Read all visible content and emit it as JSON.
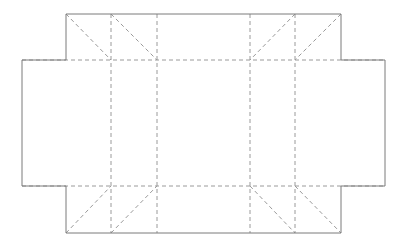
{
  "diagram": {
    "type": "box-net-dieline",
    "width": 404,
    "height": 247,
    "colors": {
      "background": "#ffffff",
      "cut_line": "#7a7a7a",
      "fold_line": "#9a9a9a"
    },
    "outline": {
      "points": [
        [
          66,
          14
        ],
        [
          341,
          14
        ],
        [
          341,
          60
        ],
        [
          385,
          60
        ],
        [
          385,
          186
        ],
        [
          341,
          186
        ],
        [
          341,
          233
        ],
        [
          66,
          233
        ],
        [
          66,
          186
        ],
        [
          22,
          186
        ],
        [
          22,
          60
        ],
        [
          66,
          60
        ]
      ]
    },
    "folds": {
      "vertical_x": [
        111,
        157,
        250,
        295
      ],
      "vertical_range": [
        14,
        233
      ],
      "horizontal_y": [
        60,
        186
      ],
      "horizontal_range": [
        22,
        385
      ]
    },
    "diagonals": [
      {
        "name": "top-left-outer",
        "from": [
          66,
          14
        ],
        "to": [
          111,
          60
        ]
      },
      {
        "name": "top-left-inner",
        "from": [
          111,
          14
        ],
        "to": [
          157,
          60
        ]
      },
      {
        "name": "top-right-inner",
        "from": [
          295,
          14
        ],
        "to": [
          250,
          60
        ]
      },
      {
        "name": "top-right-outer",
        "from": [
          341,
          14
        ],
        "to": [
          295,
          60
        ]
      },
      {
        "name": "bottom-left-outer",
        "from": [
          66,
          233
        ],
        "to": [
          111,
          186
        ]
      },
      {
        "name": "bottom-left-inner",
        "from": [
          111,
          233
        ],
        "to": [
          157,
          186
        ]
      },
      {
        "name": "bottom-right-inner",
        "from": [
          250,
          186
        ],
        "to": [
          295,
          233
        ]
      },
      {
        "name": "bottom-right-outer",
        "from": [
          295,
          186
        ],
        "to": [
          341,
          233
        ]
      }
    ]
  }
}
